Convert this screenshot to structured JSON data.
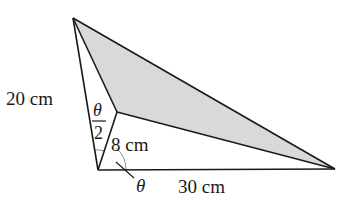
{
  "diagram": {
    "title": "",
    "colors": {
      "line": "#1a1a1a",
      "shade": "#d9d9d9",
      "arc": "#8a8a8a",
      "background": "#ffffff"
    },
    "points": {
      "top": [
        73,
        18
      ],
      "bottom_left": [
        98,
        170
      ],
      "inner": [
        117,
        112
      ],
      "right": [
        335,
        169
      ]
    },
    "labels": {
      "left_side": "20 cm",
      "inner_side": "8 cm",
      "bottom_side": "30 cm",
      "half_angle_num": "θ",
      "half_angle_den": "2",
      "angle": "θ"
    },
    "shaded_region": "triangle formed by top vertex, inner point, and right vertex"
  }
}
